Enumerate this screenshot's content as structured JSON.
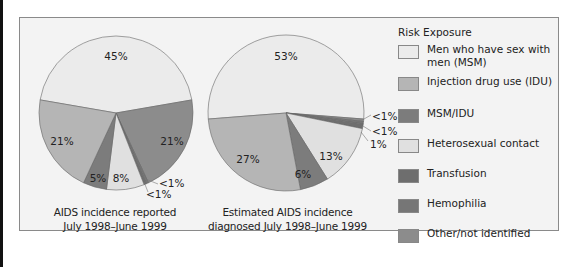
{
  "legend": {
    "title": "Risk Exposure",
    "items": [
      {
        "label": "Men who have sex with men (MSM)",
        "color": "#ebebeb"
      },
      {
        "label": "Injection drug use (IDU)",
        "color": "#b5b5b5"
      },
      {
        "label": "MSM/IDU",
        "color": "#7c7c7c"
      },
      {
        "label": "Heterosexual contact",
        "color": "#e0e0e0"
      },
      {
        "label": "Transfusion",
        "color": "#6e6e6e"
      },
      {
        "label": "Hemophilia",
        "color": "#767676"
      },
      {
        "label": "Other/not identified",
        "color": "#8c8c8c"
      }
    ]
  },
  "captions": {
    "pie1_line1": "AIDS incidence reported",
    "pie1_line2": "July 1998–June 1999",
    "pie2_line1": "Estimated AIDS incidence",
    "pie2_line2": "diagnosed July 1998–June 1999"
  },
  "chart_data": [
    {
      "type": "pie",
      "title": "AIDS incidence reported July 1998–June 1999",
      "categories": [
        "Men who have sex with men (MSM)",
        "Other/not identified",
        "Hemophilia",
        "Transfusion",
        "Heterosexual contact",
        "MSM/IDU",
        "Injection drug use (IDU)"
      ],
      "values": [
        45,
        21,
        0.5,
        0.5,
        8,
        5,
        21
      ],
      "labels": [
        "45%",
        "21%",
        "<1%",
        "<1%",
        "8%",
        "5%",
        "21%"
      ],
      "legend_position": "right"
    },
    {
      "type": "pie",
      "title": "Estimated AIDS incidence diagnosed July 1998–June 1999",
      "categories": [
        "Men who have sex with men (MSM)",
        "Other/not identified",
        "Hemophilia",
        "Transfusion",
        "Heterosexual contact",
        "MSM/IDU",
        "Injection drug use (IDU)"
      ],
      "values": [
        53,
        0.5,
        0.5,
        1,
        13,
        6,
        27
      ],
      "labels": [
        "53%",
        "<1%",
        "<1%",
        "1%",
        "13%",
        "6%",
        "27%"
      ],
      "legend_position": "right"
    }
  ]
}
